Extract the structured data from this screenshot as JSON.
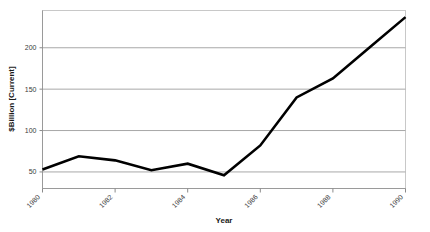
{
  "chart_data": {
    "type": "line",
    "title": "",
    "subtitle": "",
    "xlabel": "Year",
    "ylabel": "$Billion [Current]",
    "x": [
      1980,
      1981,
      1982,
      1983,
      1984,
      1985,
      1986,
      1987,
      1988,
      1989,
      1990
    ],
    "values": [
      53,
      69,
      64,
      52,
      60,
      46,
      82,
      140,
      163,
      200,
      237
    ],
    "series": [
      {
        "name": "$Billion [Current]",
        "values": [
          53,
          69,
          64,
          52,
          60,
          46,
          82,
          140,
          163,
          200,
          237
        ]
      }
    ],
    "xlim": [
      1980,
      1990
    ],
    "ylim": [
      30,
      245
    ],
    "x_tick_labels": [
      "1980",
      "1982",
      "1984",
      "1986",
      "1988",
      "1990"
    ],
    "x_tick_values": [
      1980,
      1982,
      1984,
      1986,
      1988,
      1990
    ],
    "y_tick_labels": [
      "50",
      "100",
      "150",
      "200"
    ],
    "y_tick_values": [
      50,
      100,
      150,
      200
    ],
    "grid": "horizontal",
    "legend": "none",
    "line_color": "#000000",
    "grid_color": "#a8a8a8",
    "frame_color": "#c8c8c8",
    "background_color": "#ffffff",
    "x_tick_label_rotation": -45
  }
}
